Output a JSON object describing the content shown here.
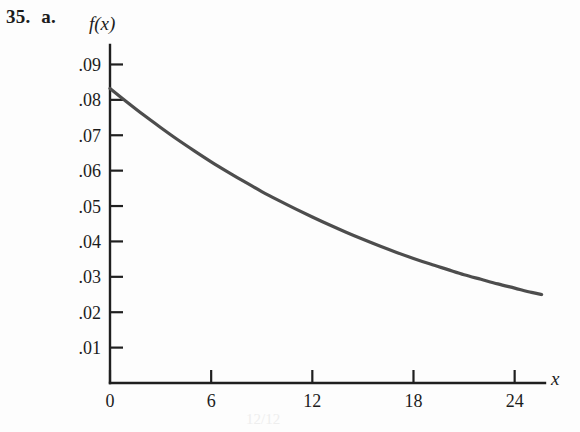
{
  "figure": {
    "problem_number": "35.",
    "part_letter": "a.",
    "bleed_through_text": "12/12"
  },
  "chart_data": {
    "type": "line",
    "title": "",
    "subtitle": "",
    "xlabel": "x",
    "ylabel": "f(x)",
    "xlim": [
      0,
      25.8
    ],
    "ylim": [
      0,
      0.0955
    ],
    "grid": false,
    "legend": null,
    "x_ticks": [
      0,
      6,
      12,
      18,
      24
    ],
    "x_tick_labels": [
      "0",
      "6",
      "12",
      "18",
      "24"
    ],
    "y_ticks": [
      0.01,
      0.02,
      0.03,
      0.04,
      0.05,
      0.06,
      0.07,
      0.08,
      0.09
    ],
    "y_tick_labels": [
      ".01",
      ".02",
      ".03",
      ".04",
      ".05",
      ".06",
      ".07",
      ".08",
      ".09"
    ],
    "series": [
      {
        "name": "f(x)",
        "color": "#4d4d4d",
        "x": [
          0,
          1,
          2,
          3,
          4,
          5,
          6,
          7,
          8,
          9,
          10,
          11,
          12,
          13,
          14,
          15,
          16,
          17,
          18,
          19,
          20,
          21,
          22,
          23,
          24,
          25,
          25.6
        ],
        "values": [
          0.0832,
          0.0794,
          0.0757,
          0.0722,
          0.0688,
          0.0656,
          0.0625,
          0.0596,
          0.0568,
          0.0541,
          0.0516,
          0.0492,
          0.0469,
          0.0447,
          0.0426,
          0.0406,
          0.0387,
          0.0369,
          0.0352,
          0.0336,
          0.0321,
          0.0306,
          0.0293,
          0.028,
          0.0268,
          0.0256,
          0.025
        ]
      }
    ]
  }
}
